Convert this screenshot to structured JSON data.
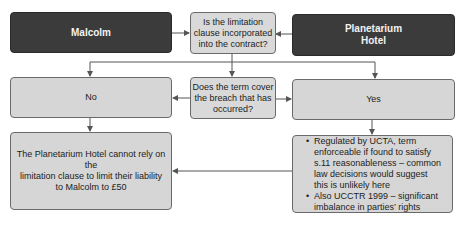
{
  "nodes": {
    "malcolm": {
      "label": "Malcolm"
    },
    "planetarium": {
      "label_line1": "Planetarium",
      "label_line2": "Hotel"
    },
    "question1": {
      "line1": "Is the limitation",
      "line2": "clause incorporated",
      "line3": "into the contract?"
    },
    "question2": {
      "line1": "Does the term cover",
      "line2": "the breach that has",
      "line3": "occurred?"
    },
    "no": {
      "label": "No"
    },
    "yes": {
      "label": "Yes"
    },
    "conclusion": {
      "line1": "The Planetarium Hotel cannot rely on the",
      "line2": "limitation clause to limit their liability",
      "line3": "to Malcolm to £50"
    },
    "analysis": {
      "bullets": [
        "Regulated by UCTA, term enforceable if found to satisfy s.11 reasonableness – common law decisions would suggest this is unlikely here",
        "Also UCCTR 1999 – significant imbalance in parties’ rights"
      ]
    }
  },
  "colors": {
    "dark_box": "#3b3b3b",
    "light_box": "#d6d6d6",
    "line": "#555555"
  }
}
